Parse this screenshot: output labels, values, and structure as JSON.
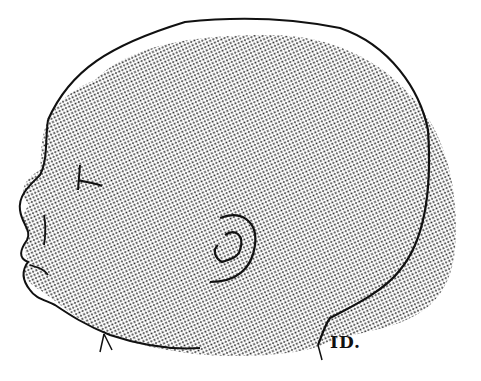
{
  "image": {
    "subject": "Stippled illustration of an infant's head in profile, facing left",
    "style": "dot stipple / halftone engraving",
    "colors": {
      "ink": "#111111",
      "paper": "#ffffff",
      "stipple": "#222222"
    },
    "signature": "ID."
  }
}
